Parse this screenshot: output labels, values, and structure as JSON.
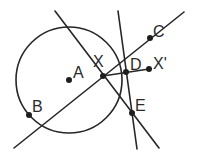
{
  "diagram": {
    "type": "geometry-construction",
    "circle_center_label": "A",
    "points": [
      {
        "id": "A",
        "label": "A"
      },
      {
        "id": "B",
        "label": "B"
      },
      {
        "id": "C",
        "label": "C"
      },
      {
        "id": "D",
        "label": "D"
      },
      {
        "id": "E",
        "label": "E"
      },
      {
        "id": "X",
        "label": "X"
      },
      {
        "id": "Xp",
        "label": "X'"
      }
    ],
    "segments": [
      {
        "id": "line-BC",
        "through": [
          "B-side",
          "X",
          "D",
          "C"
        ]
      },
      {
        "id": "line-XE",
        "through": [
          "X",
          "E"
        ]
      },
      {
        "id": "line-DE",
        "through": [
          "D",
          "E"
        ]
      },
      {
        "id": "segment-XXp",
        "through": [
          "X",
          "D",
          "X'"
        ]
      }
    ],
    "colors": {
      "stroke": "#262626",
      "background": "#ffffff"
    }
  }
}
